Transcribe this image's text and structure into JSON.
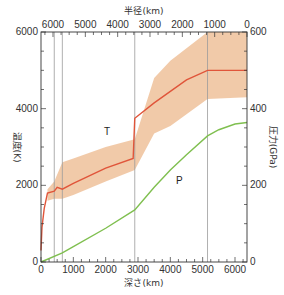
{
  "chart_data": {
    "type": "line",
    "title": "",
    "xlabel": "深さ(km)",
    "x2label": "半径(km)",
    "ylabel": "温度(K)",
    "y2label": "圧力(GPa)",
    "xlim": [
      0,
      6371
    ],
    "ylim": [
      0,
      6000
    ],
    "y2lim": [
      0,
      600
    ],
    "x_ticks": [
      0,
      1000,
      2000,
      3000,
      4000,
      5000,
      6000
    ],
    "x2_ticks": [
      6000,
      5000,
      4000,
      3000,
      2000,
      1000,
      0
    ],
    "y_ticks": [
      0,
      2000,
      4000,
      6000
    ],
    "y2_ticks": [
      0,
      200,
      400,
      600
    ],
    "grid": false,
    "boundary_lines_depth_km": [
      410,
      660,
      2900,
      5150
    ],
    "series": [
      {
        "name": "T",
        "axis": "left",
        "color": "#e0553a",
        "x": [
          0,
          30,
          100,
          200,
          410,
          500,
          660,
          1000,
          2000,
          2850,
          2900,
          3500,
          4000,
          4500,
          5150,
          5500,
          6371
        ],
        "values": [
          300,
          900,
          1400,
          1800,
          1850,
          1950,
          1900,
          2050,
          2450,
          2700,
          3750,
          4150,
          4450,
          4750,
          5000,
          5000,
          5000
        ]
      },
      {
        "name": "T uncertainty band",
        "axis": "left",
        "color": "#f0c4a0",
        "x": [
          200,
          410,
          660,
          1000,
          2000,
          2900,
          3500,
          4000,
          5150,
          6371
        ],
        "lower": [
          1600,
          1650,
          1650,
          1750,
          2100,
          2400,
          3350,
          3550,
          4250,
          4300
        ],
        "upper": [
          1900,
          2100,
          2600,
          2700,
          3000,
          3200,
          4800,
          5250,
          6000,
          6000
        ]
      },
      {
        "name": "P",
        "axis": "right",
        "color": "#7fbf4f",
        "x": [
          0,
          660,
          1000,
          2000,
          2900,
          3500,
          4000,
          4500,
          5150,
          5500,
          6000,
          6371
        ],
        "values": [
          0,
          24,
          40,
          88,
          136,
          195,
          240,
          280,
          329,
          345,
          360,
          364
        ]
      }
    ]
  },
  "labels": {
    "T": "T",
    "P": "P"
  }
}
